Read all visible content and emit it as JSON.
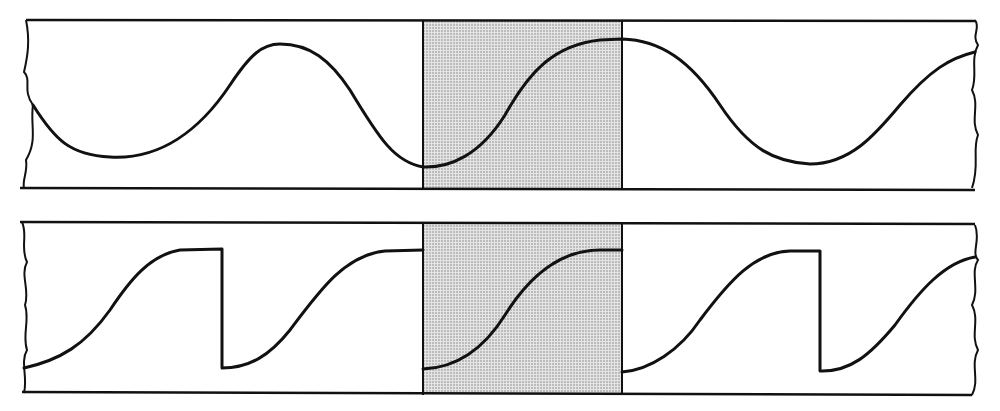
{
  "diagram": {
    "colors": {
      "ink": "#111111",
      "shade": "#d6d6d6",
      "background": "#ffffff"
    },
    "panels": [
      {
        "id": "sine-strip",
        "waveform": "sinusoid",
        "box": {
          "x1": 22,
          "x2": 975,
          "y1": 20,
          "y2": 188
        },
        "shaded_window": {
          "x1": 423,
          "x2": 622
        },
        "path": "M 33 105 C 55 140, 70 155, 110 157 C 160 160, 200 130, 230 85 C 250 55, 262 44, 280 44 C 310 44, 330 60, 350 90 C 380 140, 395 162, 423 167 C 450 168, 480 155, 505 115 C 530 70, 555 45, 600 40 L 622 39 C 660 40, 690 60, 720 105 C 750 150, 775 162, 810 164 C 850 164, 875 135, 900 105 C 930 70, 950 58, 975 52"
      },
      {
        "id": "sawtooth-strip",
        "waveform": "rounded sawtooth",
        "box": {
          "x1": 22,
          "x2": 975,
          "y1": 222,
          "y2": 393
        },
        "shaded_window": {
          "x1": 423,
          "x2": 622
        },
        "path": "M 24 368 C 60 360, 85 345, 110 310 C 130 280, 150 255, 180 250 L 222 249 L 222 368 C 250 368, 270 355, 290 330 C 320 290, 345 255, 385 251 L 423 250 M 423 369 C 450 368, 480 355, 505 315 C 530 275, 560 250, 600 250 L 622 250 M 622 372 C 650 370, 680 350, 700 320 C 730 280, 755 252, 790 251 L 820 251 L 820 371 C 850 372, 870 355, 895 325 C 920 290, 945 262, 975 257"
      }
    ],
    "torn_edges": {
      "top_left": "M 26 20 C 30 40, 28 55, 24 72 C 32 80, 22 90, 33 105 C 30 125, 38 140, 26 160 C 28 172, 22 180, 24 188",
      "top_right": "M 975 20 C 981 28, 971 35, 978 45 C 970 60, 978 75, 972 90 C 980 105, 970 120, 978 135 C 972 150, 980 165, 972 188",
      "bottom_left": "M 22 222 C 28 235, 20 248, 27 262 C 20 275, 30 290, 25 305 C 30 320, 22 335, 27 350 C 20 362, 28 378, 24 393",
      "bottom_right": "M 975 225 C 981 240, 971 252, 978 260 C 970 272, 980 290, 972 305 C 980 320, 970 335, 978 350 C 970 365, 980 380, 972 395"
    }
  }
}
